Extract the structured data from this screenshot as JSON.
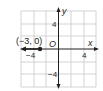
{
  "figure": {
    "type": "coordinate-plane-graph",
    "axes": {
      "x_label": "x",
      "y_label": "y",
      "origin_label": "O",
      "x_ticks": [
        "−4",
        "4"
      ],
      "y_ticks": [
        "4",
        "−4"
      ],
      "range": [
        -6,
        6
      ],
      "grid_spacing": 2
    },
    "point": {
      "label": "(−3, 0)",
      "x": -3,
      "y": 0,
      "style": "closed"
    },
    "ray": {
      "start": [
        -3,
        0
      ],
      "direction": "left"
    },
    "colors": {
      "grid": "#c8c8c8",
      "axis": "#231f20",
      "ray": "#231f20",
      "background": "#ffffff"
    }
  }
}
